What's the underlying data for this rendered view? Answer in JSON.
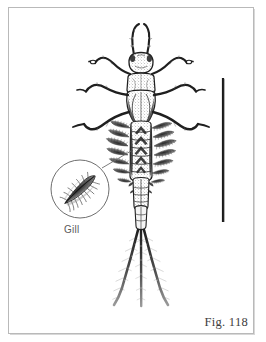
{
  "figure": {
    "caption": "Fig. 118",
    "background_color": "#ffffff",
    "border_color": "#b9b9b9",
    "ink_color": "#1a1a1a",
    "annotations": [
      {
        "id": "gill-callout",
        "label": "Gill",
        "kind": "magnified-circular-inset",
        "circle": {
          "cx": 80,
          "cy": 189,
          "r": 29
        },
        "leader_from": {
          "x": 102,
          "y": 168
        },
        "leader_to": {
          "x": 131,
          "y": 151
        },
        "label_position": {
          "x": 64,
          "y": 224
        }
      }
    ],
    "scale_bar": {
      "orientation": "vertical",
      "x": 223,
      "y_top": 78,
      "y_bottom": 222,
      "thickness": 2,
      "color": "#1a1a1a"
    },
    "specimen": {
      "name": "mayfly-nymph",
      "axis_x": 141,
      "head_y": 62,
      "tail_y": 306,
      "parts": [
        {
          "name": "antennae",
          "count": 2
        },
        {
          "name": "head",
          "count": 1
        },
        {
          "name": "pronotum",
          "count": 1
        },
        {
          "name": "mesonotum-wingpads",
          "count": 1
        },
        {
          "name": "legs",
          "count": 6
        },
        {
          "name": "abdominal-gills",
          "count": 14
        },
        {
          "name": "abdominal-segments",
          "count": 10
        },
        {
          "name": "caudal-filaments",
          "count": 3
        }
      ]
    }
  }
}
